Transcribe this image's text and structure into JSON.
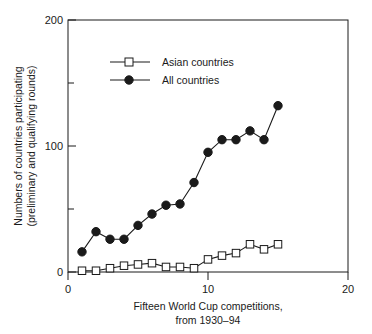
{
  "chart_data": {
    "type": "line",
    "title": "",
    "xlabel": "Fifteen World Cup competitions, from 1930–94",
    "xlabel_line1": "Fifteen World Cup competitions,",
    "xlabel_line2": "from 1930–94",
    "ylabel": "Numbers of countries participating (preliminary and qualifying rounds)",
    "ylabel_line1": "Numbers of countries participating",
    "ylabel_line2": "(preliminary and qualifying rounds)",
    "x": [
      1,
      2,
      3,
      4,
      5,
      6,
      7,
      8,
      9,
      10,
      11,
      12,
      13,
      14,
      15
    ],
    "xlim": [
      0,
      20
    ],
    "ylim": [
      0,
      200
    ],
    "xticks": [
      0,
      10,
      20
    ],
    "xtick_labels": [
      "0",
      "10",
      "20"
    ],
    "yticks": [
      0,
      100,
      200
    ],
    "ytick_labels": [
      "0",
      "100",
      "200"
    ],
    "yticks_minor": [
      50,
      150
    ],
    "grid": false,
    "legend_position": "upper-left-inside",
    "series": [
      {
        "name": "Asian countries",
        "marker": "open-square",
        "values": [
          1,
          1,
          3,
          5,
          6,
          7,
          4,
          4,
          3,
          10,
          13,
          15,
          22,
          18,
          22
        ]
      },
      {
        "name": "All countries",
        "marker": "filled-circle",
        "values": [
          16,
          32,
          26,
          26,
          37,
          46,
          53,
          54,
          71,
          95,
          105,
          105,
          112,
          105,
          132
        ]
      }
    ]
  },
  "legend": {
    "items": [
      {
        "label": "Asian countries"
      },
      {
        "label": "All countries"
      }
    ]
  },
  "colors": {
    "ink": "#1a1a1a",
    "background": "#ffffff"
  }
}
